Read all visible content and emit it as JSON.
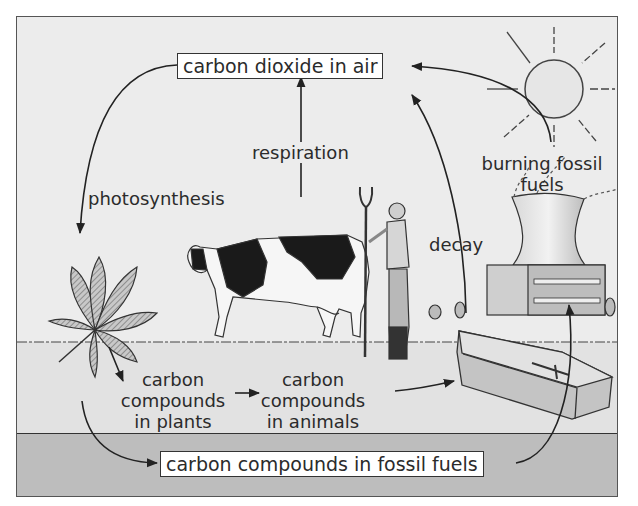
{
  "boxes": {
    "air": "carbon dioxide in air",
    "fossil": "carbon compounds in fossil fuels"
  },
  "processes": {
    "photosynthesis": "photosynthesis",
    "respiration": "respiration",
    "decay": "decay",
    "burning_line1": "burning fossil",
    "burning_line2": "fuels"
  },
  "compounds": {
    "plants_line1": "carbon",
    "plants_line2": "compounds",
    "plants_line3": "in plants",
    "animals_line1": "carbon",
    "animals_line2": "compounds",
    "animals_line3": "in animals"
  },
  "illustrations": [
    "sun",
    "leaf",
    "cow",
    "farmer-with-pitchfork",
    "power-station-cooling-tower",
    "coffin"
  ],
  "colors": {
    "background": "#ececec",
    "underground": "#bdbdbd",
    "box_fill": "#ffffff",
    "line": "#222222"
  }
}
